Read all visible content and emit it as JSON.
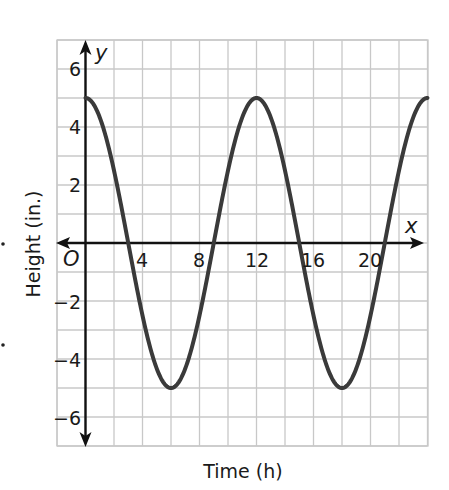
{
  "chart_data": {
    "type": "line",
    "title": "",
    "xlabel": "Time (h)",
    "ylabel": "Height (in.)",
    "x_axis_letter": "x",
    "y_axis_letter": "y",
    "origin_label": "O",
    "xlim": [
      -2,
      24
    ],
    "ylim": [
      -7,
      7
    ],
    "grid": true,
    "grid_step_x": 2,
    "grid_step_y": 1,
    "x_ticks": [
      4,
      8,
      12,
      16,
      20
    ],
    "x_tick_labels": [
      "4",
      "8",
      "12",
      "16",
      "20"
    ],
    "y_ticks": [
      6,
      4,
      2,
      -2,
      -4,
      -6
    ],
    "y_tick_labels": [
      "6",
      "4",
      "2",
      "−2",
      "−4",
      "−6"
    ],
    "series": [
      {
        "name": "height",
        "equation": "y = 5cos(πx/6)",
        "amplitude": 5,
        "period": 12,
        "color": "#3a3a3a",
        "x": [
          0,
          3,
          6,
          9,
          12,
          15,
          18,
          21,
          24
        ],
        "values": [
          5,
          0,
          -5,
          0,
          5,
          0,
          -5,
          0,
          5
        ]
      }
    ],
    "legend": null
  },
  "colors": {
    "grid": "#c8c8c8",
    "axis": "#111111",
    "curve": "#3a3a3a",
    "background": "#ffffff"
  }
}
